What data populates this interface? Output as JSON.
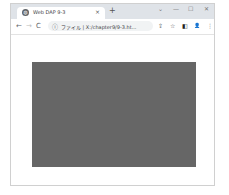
{
  "browser": {
    "tab": {
      "favicon": "globe-icon",
      "title": "Web DAP 9-3",
      "close": "×"
    },
    "new_tab": "+",
    "window_controls": {
      "dropdown": "⌄",
      "minimize": "—",
      "maximize": "☐",
      "close": "✕"
    },
    "toolbar": {
      "back": "←",
      "forward": "→",
      "reload": "C",
      "info_icon": "ⓘ",
      "address": "ファイル | X:/chapter9/9-3.ht...",
      "share": "⇪",
      "bookmark": "☆",
      "sidepanel": "◧",
      "profile": "👤",
      "menu": "⋮"
    }
  },
  "page": {
    "canvas": {
      "fill_color": "#666666"
    }
  }
}
